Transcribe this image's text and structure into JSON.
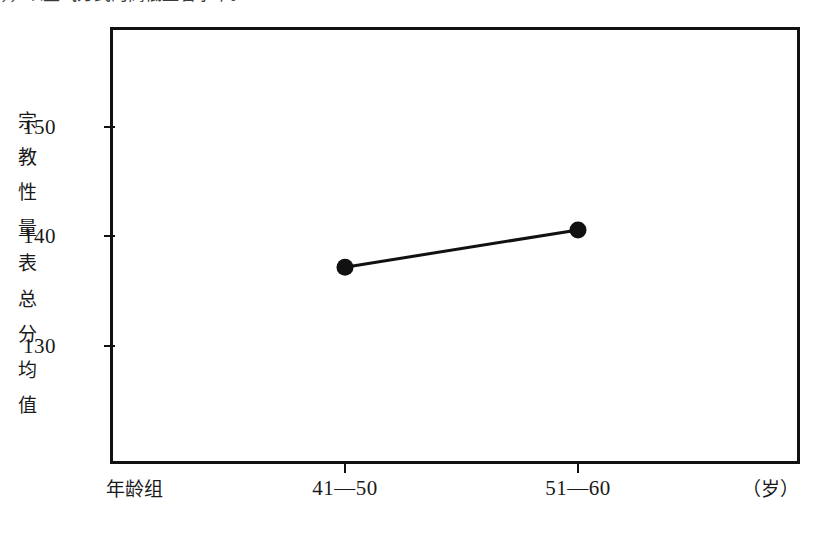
{
  "page": {
    "clipped_header_text": "，，以生气方式的高低显著水平。"
  },
  "chart_data": {
    "type": "line",
    "title": "",
    "xlabel": "年龄组",
    "xunit": "（岁）",
    "ylabel": "宗教性量表总分均值",
    "categories": [
      "41—50",
      "51—60"
    ],
    "values": [
      137.2,
      140.6
    ],
    "series": [
      {
        "name": "宗教性量表总分均值",
        "values": [
          137.2,
          140.6
        ]
      }
    ],
    "yticks": [
      130,
      140,
      150
    ],
    "ytick_labels": [
      "130",
      "140",
      "150"
    ],
    "ylim": [
      123.5,
      163.5
    ],
    "grid": false,
    "legend": false,
    "marker": "filled-circle",
    "line_color": "#111111",
    "marker_color": "#111111",
    "frame_color": "#111111",
    "background_color": "#ffffff"
  },
  "axis": {
    "y_title_chars": [
      "宗",
      "教",
      "性",
      "量",
      "表",
      "总",
      "分",
      "均",
      "值"
    ]
  }
}
